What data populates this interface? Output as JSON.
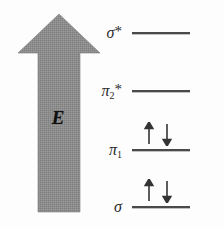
{
  "diagram": {
    "type": "molecular-orbital-energy-diagram",
    "axis": {
      "label": "E",
      "meaning": "energy",
      "direction": "up",
      "icon": "up-arrow-icon",
      "color": "#8a8a8a"
    },
    "levels": [
      {
        "id": "sigma-star",
        "label_base": "σ",
        "label_sub": "",
        "label_star": "*",
        "electrons": 0,
        "electron_glyphs": "",
        "y": 32
      },
      {
        "id": "pi-2-star",
        "label_base": "π",
        "label_sub": "2",
        "label_star": "*",
        "electrons": 0,
        "electron_glyphs": "",
        "y": 90
      },
      {
        "id": "pi-1",
        "label_base": "π",
        "label_sub": "1",
        "label_star": "",
        "electrons": 2,
        "electron_glyphs": "↑↓",
        "y": 149
      },
      {
        "id": "sigma",
        "label_base": "σ",
        "label_sub": "",
        "label_star": "",
        "electrons": 2,
        "electron_glyphs": "↑↓",
        "y": 206
      }
    ],
    "colors": {
      "level_line": "#4a4a4a",
      "arrow_fill": "#8a8a8a",
      "text": "#2a2a2a",
      "background": "#fdfdfd"
    }
  }
}
